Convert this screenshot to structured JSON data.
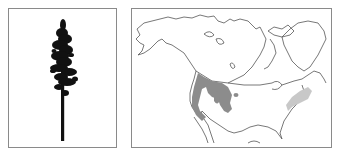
{
  "figure": {
    "tree_panel": {
      "subject": "tree-silhouette",
      "icon": "conifer-tree-icon",
      "colors": {
        "tree": "#111111",
        "frame": "#8a8a8a",
        "background": "#ffffff"
      }
    },
    "map_panel": {
      "subject": "north-america-range-map",
      "regions": [
        {
          "name": "western-range",
          "color": "#8c8c8c"
        },
        {
          "name": "eastern-range",
          "color": "#c8c8c8"
        }
      ],
      "colors": {
        "outline": "#555555",
        "frame": "#8a8a8a",
        "background": "#ffffff"
      }
    }
  }
}
